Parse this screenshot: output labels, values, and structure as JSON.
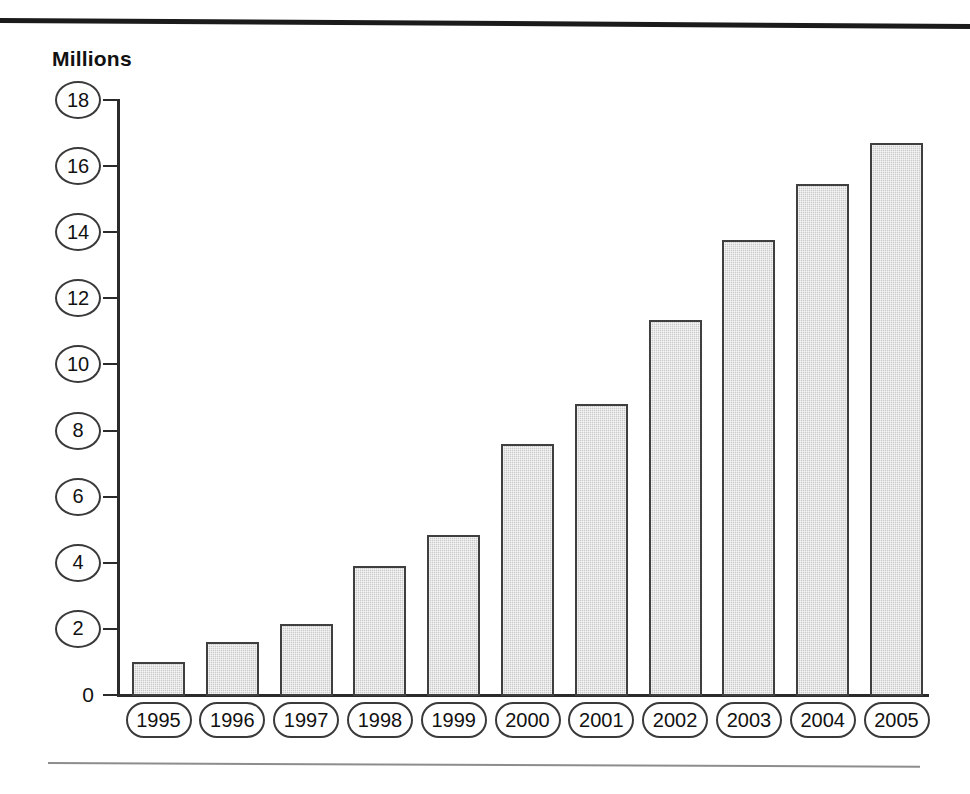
{
  "figure": {
    "axis_title": "Millions",
    "zero_label": "0",
    "rule_color": "#1b1b1b",
    "bar_fill": "#cacaca",
    "bar_border": "#3f3f3f"
  },
  "chart_data": {
    "type": "bar",
    "title": "",
    "xlabel": "",
    "ylabel": "Millions",
    "ylim": [
      0,
      18
    ],
    "yticks": [
      0,
      2,
      4,
      6,
      8,
      10,
      12,
      14,
      16,
      18
    ],
    "ytick_labels": [
      "0",
      "2",
      "4",
      "6",
      "8",
      "10",
      "12",
      "14",
      "16",
      "18"
    ],
    "grid": false,
    "legend": null,
    "categories": [
      "1995",
      "1996",
      "1997",
      "1998",
      "1999",
      "2000",
      "2001",
      "2002",
      "2003",
      "2004",
      "2005"
    ],
    "values": [
      1.0,
      1.6,
      2.15,
      3.9,
      4.85,
      7.6,
      8.8,
      11.35,
      13.75,
      15.45,
      16.7
    ]
  }
}
